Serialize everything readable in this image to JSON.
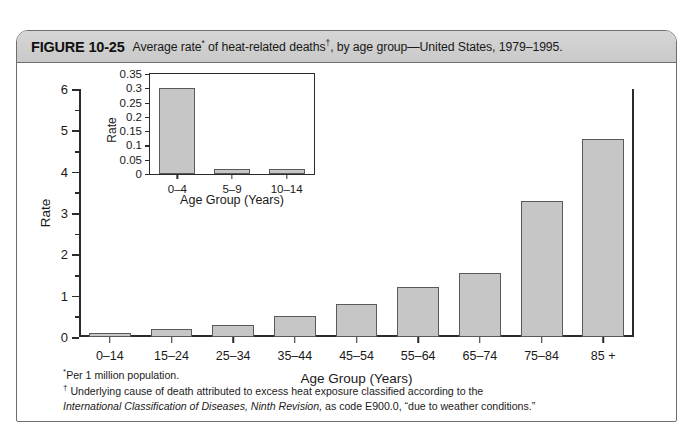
{
  "figure": {
    "number": "FIGURE 10-25",
    "title_before_star": "Average rate",
    "star": "*",
    "title_mid": " of heat-related deaths",
    "dagger": "†",
    "title_after": ", by age group—United States, 1979–1995."
  },
  "chart_data": [
    {
      "type": "bar",
      "id": "main",
      "title": "",
      "xlabel": "Age Group (Years)",
      "ylabel": "Rate",
      "categories": [
        "0–14",
        "15–24",
        "25–34",
        "35–44",
        "45–54",
        "55–64",
        "65–74",
        "75–84",
        "85 +"
      ],
      "values": [
        0.1,
        0.2,
        0.3,
        0.5,
        0.8,
        1.2,
        1.55,
        3.3,
        4.8
      ],
      "ylim": [
        0,
        6
      ],
      "ytick_labels": [
        "0",
        "1",
        "2",
        "3",
        "4",
        "5",
        "6"
      ],
      "ytick_values": [
        0,
        1,
        2,
        3,
        4,
        5,
        6
      ],
      "yminor_values": [
        0.5,
        1.5,
        2.5,
        3.5,
        4.5,
        5.5
      ],
      "grid": false,
      "legend": "none"
    },
    {
      "type": "bar",
      "id": "inset",
      "title": "",
      "xlabel": "Age Group (Years)",
      "ylabel": "Rate",
      "categories": [
        "0–4",
        "5–9",
        "10–14"
      ],
      "values": [
        0.3,
        0.018,
        0.018
      ],
      "ylim": [
        0,
        0.35
      ],
      "ytick_labels": [
        "0",
        "0.05",
        "0.1",
        "0.15",
        "0.2",
        "0.25",
        "0.3",
        "0.35"
      ],
      "ytick_values": [
        0,
        0.05,
        0.1,
        0.15,
        0.2,
        0.25,
        0.3,
        0.35
      ],
      "grid": false,
      "legend": "none"
    }
  ],
  "footnotes": {
    "line1_mark": "*",
    "line1": "Per 1 million population.",
    "line2_mark": "†",
    "line2": " Underlying cause of death attributed to excess heat exposure classified according to the",
    "line3_italic": "International Classification of Diseases, Ninth Revision,",
    "line3_rest": " as code E900.0, “due to weather conditions.”"
  },
  "colors": {
    "bar_fill": "#c6c6c6",
    "bar_edge": "#5a5a5a",
    "axis": "#2b2b2b",
    "caption_bg": "#d0d0d0",
    "frame": "#6e6e6e"
  }
}
